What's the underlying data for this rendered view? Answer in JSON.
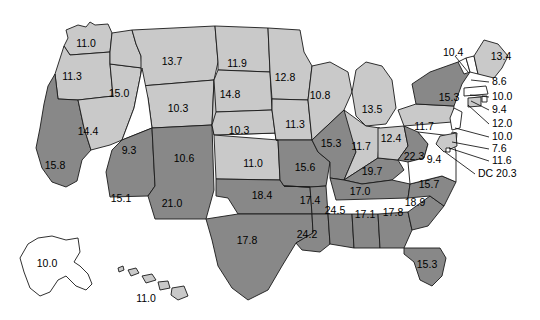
{
  "figure": {
    "type": "choropleth-map",
    "region": "United States",
    "shading_legend": {
      "white": "lowest tier",
      "light_gray": "middle tier",
      "dark_gray": "highest tier"
    },
    "colors": {
      "white": "#ffffff",
      "light_gray": "#c9c9c9",
      "dark_gray": "#888888",
      "outline": "#1a1a1a",
      "text": "#000000",
      "background": "#ffffff"
    }
  },
  "chart_data": {
    "type": "map",
    "title": "",
    "xlabel": "",
    "ylabel": "",
    "categories": [
      "WA",
      "OR",
      "CA",
      "NV",
      "ID",
      "MT",
      "WY",
      "UT",
      "AZ",
      "NM",
      "CO",
      "ND",
      "SD",
      "NE",
      "KS",
      "OK",
      "TX",
      "MN",
      "IA",
      "MO",
      "AR",
      "LA",
      "WI",
      "IL",
      "MS",
      "MI",
      "IN",
      "KY",
      "TN",
      "AL",
      "GA",
      "FL",
      "SC",
      "NC",
      "OH",
      "WV",
      "VA",
      "PA",
      "NY",
      "VT",
      "NH",
      "ME",
      "MA",
      "RI",
      "CT",
      "NJ",
      "DE",
      "MD",
      "DC",
      "AK",
      "HI"
    ],
    "values": [
      11.0,
      11.3,
      15.8,
      14.4,
      15.0,
      13.7,
      10.3,
      9.3,
      15.1,
      21.0,
      10.6,
      11.9,
      14.8,
      10.3,
      11.0,
      18.4,
      17.8,
      12.8,
      11.3,
      15.6,
      17.4,
      24.2,
      10.8,
      15.3,
      24.5,
      13.5,
      11.7,
      19.7,
      17.0,
      17.1,
      17.8,
      15.3,
      18.9,
      15.7,
      12.4,
      22.3,
      9.4,
      11.7,
      15.3,
      10.4,
      8.6,
      13.4,
      10.0,
      9.4,
      12.0,
      10.0,
      7.6,
      11.6,
      20.3,
      10.0,
      11.0
    ],
    "shades": [
      "light",
      "light",
      "dark",
      "light",
      "light",
      "light",
      "light",
      "white",
      "dark",
      "dark",
      "light",
      "light",
      "light",
      "light",
      "light",
      "dark",
      "dark",
      "light",
      "light",
      "dark",
      "dark",
      "dark",
      "light",
      "dark",
      "dark",
      "light",
      "light",
      "dark",
      "dark",
      "dark",
      "dark",
      "dark",
      "dark",
      "dark",
      "light",
      "dark",
      "white",
      "light",
      "dark",
      "white",
      "white",
      "light",
      "white",
      "white",
      "light",
      "white",
      "white",
      "light",
      "white",
      "white",
      "light"
    ]
  },
  "labels": {
    "inline": [
      {
        "id": "wa",
        "text": "11.0",
        "x": 86,
        "y": 44
      },
      {
        "id": "or",
        "text": "11.3",
        "x": 72,
        "y": 77
      },
      {
        "id": "id",
        "text": "15.0",
        "x": 119,
        "y": 94
      },
      {
        "id": "mt",
        "text": "13.7",
        "x": 172,
        "y": 62
      },
      {
        "id": "nd",
        "text": "11.9",
        "x": 237,
        "y": 64
      },
      {
        "id": "sd",
        "text": "14.8",
        "x": 230,
        "y": 95
      },
      {
        "id": "wy",
        "text": "10.3",
        "x": 178,
        "y": 109
      },
      {
        "id": "ne",
        "text": "10.3",
        "x": 239,
        "y": 131
      },
      {
        "id": "mn",
        "text": "12.8",
        "x": 285,
        "y": 78
      },
      {
        "id": "wi",
        "text": "10.8",
        "x": 320,
        "y": 96
      },
      {
        "id": "mi",
        "text": "13.5",
        "x": 372,
        "y": 110
      },
      {
        "id": "ia",
        "text": "11.3",
        "x": 295,
        "y": 125
      },
      {
        "id": "ca",
        "text": "15.8",
        "x": 55,
        "y": 166
      },
      {
        "id": "nv",
        "text": "14.4",
        "x": 88,
        "y": 132
      },
      {
        "id": "ut",
        "text": "9.3",
        "x": 129,
        "y": 151
      },
      {
        "id": "co",
        "text": "10.6",
        "x": 184,
        "y": 159
      },
      {
        "id": "ks",
        "text": "11.0",
        "x": 253,
        "y": 164
      },
      {
        "id": "mo",
        "text": "15.6",
        "x": 305,
        "y": 168
      },
      {
        "id": "il",
        "text": "15.3",
        "x": 331,
        "y": 144
      },
      {
        "id": "in",
        "text": "11.7",
        "x": 361,
        "y": 147
      },
      {
        "id": "oh",
        "text": "12.4",
        "x": 391,
        "y": 139
      },
      {
        "id": "wv",
        "text": "22.3",
        "x": 414,
        "y": 157
      },
      {
        "id": "pa",
        "text": "11.7",
        "x": 424,
        "y": 127
      },
      {
        "id": "ny",
        "text": "15.3",
        "x": 449,
        "y": 98
      },
      {
        "id": "me",
        "text": "13.4",
        "x": 501,
        "y": 57
      },
      {
        "id": "va",
        "text": "9.4",
        "x": 434,
        "y": 160
      },
      {
        "id": "ky",
        "text": "19.7",
        "x": 372,
        "y": 172
      },
      {
        "id": "tn",
        "text": "17.0",
        "x": 360,
        "y": 192
      },
      {
        "id": "nc",
        "text": "15.7",
        "x": 429,
        "y": 185
      },
      {
        "id": "sc",
        "text": "18.9",
        "x": 415,
        "y": 203
      },
      {
        "id": "ga",
        "text": "17.8",
        "x": 393,
        "y": 213
      },
      {
        "id": "al",
        "text": "17.1",
        "x": 365,
        "y": 215
      },
      {
        "id": "ms",
        "text": "24.5",
        "x": 335,
        "y": 211
      },
      {
        "id": "ar",
        "text": "17.4",
        "x": 310,
        "y": 201
      },
      {
        "id": "la",
        "text": "24.2",
        "x": 307,
        "y": 235
      },
      {
        "id": "ok",
        "text": "18.4",
        "x": 262,
        "y": 196
      },
      {
        "id": "tx",
        "text": "17.8",
        "x": 247,
        "y": 241
      },
      {
        "id": "nm",
        "text": "21.0",
        "x": 172,
        "y": 204
      },
      {
        "id": "az",
        "text": "15.1",
        "x": 121,
        "y": 199
      },
      {
        "id": "fl",
        "text": "15.3",
        "x": 427,
        "y": 265
      },
      {
        "id": "ak",
        "text": "10.0",
        "x": 47,
        "y": 264
      },
      {
        "id": "hi",
        "text": "11.0",
        "x": 146,
        "y": 299
      }
    ],
    "callouts": [
      {
        "id": "vt",
        "text": "10.4",
        "tx": 443,
        "ty": 53,
        "x1": 455,
        "y1": 56,
        "x2": 468,
        "y2": 72
      },
      {
        "id": "nh",
        "text": "8.6",
        "tx": 492,
        "ty": 82,
        "x1": 489,
        "y1": 82,
        "x2": 471,
        "y2": 80
      },
      {
        "id": "ma",
        "text": "10.0",
        "tx": 492,
        "ty": 97,
        "x1": 489,
        "y1": 97,
        "x2": 470,
        "y2": 95
      },
      {
        "id": "ri",
        "text": "9.4",
        "tx": 492,
        "ty": 110,
        "x1": 489,
        "y1": 110,
        "x2": 471,
        "y2": 101
      },
      {
        "id": "ct",
        "text": "12.0",
        "tx": 492,
        "ty": 124,
        "x1": 489,
        "y1": 124,
        "x2": 468,
        "y2": 105
      },
      {
        "id": "nj",
        "text": "10.0",
        "tx": 492,
        "ty": 137,
        "x1": 489,
        "y1": 137,
        "x2": 455,
        "y2": 128
      },
      {
        "id": "de",
        "text": "7.6",
        "tx": 492,
        "ty": 149,
        "x1": 489,
        "y1": 149,
        "x2": 452,
        "y2": 142
      },
      {
        "id": "md",
        "text": "11.6",
        "tx": 492,
        "ty": 161,
        "x1": 489,
        "y1": 161,
        "x2": 449,
        "y2": 148
      },
      {
        "id": "dc",
        "text": "DC 20.3",
        "tx": 478,
        "ty": 174,
        "x1": 475,
        "y1": 174,
        "x2": 445,
        "y2": 152
      }
    ]
  }
}
